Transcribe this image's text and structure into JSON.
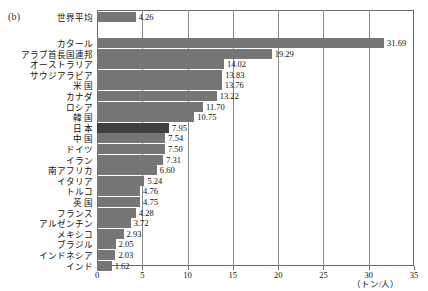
{
  "figure": {
    "panel_label": "(b)",
    "unit_label": "（トン/人）"
  },
  "axis": {
    "ticks": [
      "0",
      "5",
      "10",
      "15",
      "20",
      "25",
      "30",
      "35"
    ],
    "min": 0,
    "max": 35,
    "step": 5
  },
  "chart_data": {
    "type": "bar",
    "orientation": "horizontal",
    "title": "",
    "subtitle": "",
    "xlabel": "（トン/人）",
    "ylabel": "",
    "xlim": [
      0,
      35
    ],
    "xticks": [
      0,
      5,
      10,
      15,
      20,
      25,
      30,
      35
    ],
    "grid": true,
    "grid_axis": "x",
    "legend": false,
    "legend_position": "none",
    "annotations": [
      "(b)"
    ],
    "bar_color": "#767676",
    "highlight_color": "#3f3f3f",
    "highlight_categories": [
      "日 本"
    ],
    "reference_row": {
      "category": "世界平均",
      "value": 4.26,
      "label": "4.26"
    },
    "categories": [
      "カタール",
      "アラブ首長国連邦",
      "オーストラリア",
      "サウジアラビア",
      "米 国",
      "カナダ",
      "ロシア",
      "韓 国",
      "日 本",
      "中 国",
      "ドイツ",
      "イラン",
      "南アフリカ",
      "イタリア",
      "トルコ",
      "英 国",
      "フランス",
      "アルゼンチン",
      "メキシコ",
      "ブラジル",
      "インドネシア",
      "インド"
    ],
    "values": [
      31.69,
      19.29,
      14.02,
      13.83,
      13.76,
      13.22,
      11.7,
      10.75,
      7.95,
      7.54,
      7.5,
      7.31,
      6.6,
      5.24,
      4.76,
      4.75,
      4.28,
      3.72,
      2.93,
      2.05,
      2.03,
      1.62
    ],
    "value_labels": [
      "31.69",
      "19.29",
      "14.02",
      "13.83",
      "13.76",
      "13.22",
      "11.70",
      "10.75",
      "7.95",
      "7.54",
      "7.50",
      "7.31",
      "6.60",
      "5.24",
      "4.76",
      "4.75",
      "4.28",
      "3.72",
      "2.93",
      "2.05",
      "2.03",
      "1.62"
    ]
  }
}
